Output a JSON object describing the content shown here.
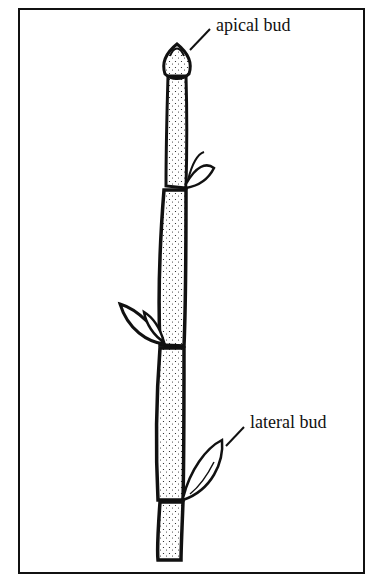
{
  "diagram": {
    "type": "botanical-illustration",
    "labels": {
      "apical": "apical bud",
      "lateral": "lateral bud"
    },
    "colors": {
      "ink": "#111111",
      "background": "#ffffff"
    }
  }
}
